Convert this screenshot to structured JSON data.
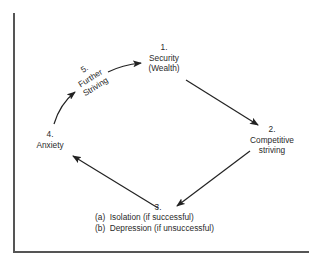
{
  "diagram": {
    "type": "cycle",
    "nodes": [
      {
        "id": "1",
        "number": "1.",
        "lines": [
          "Security",
          "(Wealth)"
        ]
      },
      {
        "id": "2",
        "number": "2.",
        "lines": [
          "Competitive",
          "striving"
        ]
      },
      {
        "id": "3",
        "number": "3.",
        "outcomes": [
          "(a)  Isolation (if successful)",
          "(b)  Depression (if unsuccessful)"
        ]
      },
      {
        "id": "4",
        "number": "4.",
        "lines": [
          "Anxiety"
        ]
      },
      {
        "id": "5",
        "number": "5.",
        "lines": [
          "Further",
          "Striving"
        ]
      }
    ],
    "edges": [
      {
        "from": "1",
        "to": "2"
      },
      {
        "from": "2",
        "to": "3"
      },
      {
        "from": "3",
        "to": "4"
      },
      {
        "from": "4",
        "to": "5"
      },
      {
        "from": "5",
        "to": "1"
      }
    ],
    "colors": {
      "line": "#222222",
      "frame": "#555555",
      "text": "#2a2a2a"
    }
  }
}
